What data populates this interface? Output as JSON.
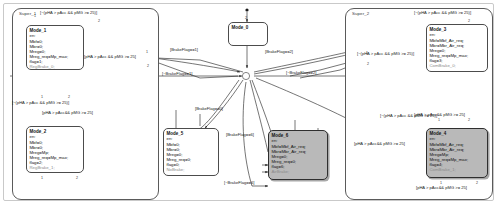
{
  "diagram": {
    "type": "statechart"
  },
  "superstates": [
    {
      "id": "super_1",
      "label": "Super_1"
    },
    {
      "id": "super_2",
      "label": "Super_2"
    }
  ],
  "states": [
    {
      "id": "mode_0",
      "name": "Mode_0",
      "shaded": false,
      "lines": []
    },
    {
      "id": "mode_1",
      "name": "Mode_1",
      "shaded": false,
      "lines": [
        "en:",
        "Mbf=0;",
        "Mbr=0;",
        "Mreg=0;",
        "Mreg_req=Mp_max;",
        "flag=1;",
        "RegBrake_0;"
      ]
    },
    {
      "id": "mode_2",
      "name": "Mode_2",
      "shaded": false,
      "lines": [
        "en:",
        "Mbf=0;",
        "Mbr=0;",
        "Mreg=Mp;",
        "Mreg_req=Mp_max;",
        "flag=2;",
        "RegBrake_1;"
      ]
    },
    {
      "id": "mode_3",
      "name": "Mode_3",
      "shaded": false,
      "lines": [
        "en:",
        "Mbf=Mbf_Air_req;",
        "Mbr=Mbr_Air_req;",
        "Mreg=0;",
        "Mreg_req=Mp_max;",
        "flag=3;",
        "ComBrake_0;"
      ]
    },
    {
      "id": "mode_4",
      "name": "Mode_4",
      "shaded": true,
      "lines": [
        "en:",
        "Mbf=Mbf_Air_req;",
        "Mbr=Mbr_Air_req;",
        "Mreg=Mp;",
        "Mreg_req=Mp_max;",
        "flag=4;",
        "ComBrake_1;"
      ]
    },
    {
      "id": "mode_5",
      "name": "Mode_5",
      "shaded": false,
      "lines": [
        "en:",
        "Mbf=0;",
        "Mbr=0;",
        "Mreg=0;",
        "Mreg_req=0;",
        "flag=0;",
        "NoBrake;"
      ]
    },
    {
      "id": "mode_6",
      "name": "Mode_6",
      "shaded": true,
      "lines": [
        "en:",
        "Mbf=Mbf_Air_req;",
        "Mbr=Mbr_Air_req;",
        "Mreg=0;",
        "Mreg_req=0;",
        "flag=6;",
        "AirBrake;"
      ]
    }
  ],
  "transition_labels": [
    {
      "id": "t_s1_top",
      "text": "[~(pHA > pAcc && pMG >= 25)]"
    },
    {
      "id": "t_s1_mid_right",
      "text": "[pHA > pAcc && pMG >= 25]"
    },
    {
      "id": "t_s1_bot_left",
      "text": "[~(pHA > pAcc && pMG >= 25)]"
    },
    {
      "id": "t_s1_bot_right",
      "text": "[pHA > pAcc&& pMG >= 25]"
    },
    {
      "id": "t_bf1",
      "text": "[BrakeFlag==1]"
    },
    {
      "id": "t_nbf1",
      "text": "[~BrakeFlag==1]"
    },
    {
      "id": "t_nbf2",
      "text": "[~BrakeFlag==2]"
    },
    {
      "id": "t_bf2",
      "text": "[BrakeFlag==2]"
    },
    {
      "id": "t_bf0",
      "text": "[BrakeFlag==0]"
    },
    {
      "id": "t_bf6",
      "text": "[BrakeFlag==6]"
    },
    {
      "id": "t_nbf6",
      "text": "[~BrakeFlag==6]"
    },
    {
      "id": "t_s2_top",
      "text": "[~(pHA > pAcc && pMG >= 25)]"
    },
    {
      "id": "t_s2_left",
      "text": "[~(pHA > pAcc && pMG >= 25)]"
    },
    {
      "id": "t_s2_mid",
      "text": "[~(pHA > pAcc && pMG >= 25)]"
    },
    {
      "id": "t_s2_m4_top",
      "text": "[pHA > pAcc&& pMG >= 25]"
    },
    {
      "id": "t_s2_m4_left",
      "text": "[pHA > pAcc&& pMG >= 25]"
    },
    {
      "id": "t_s2_m4_bot",
      "text": "[pHA > pAcc&& pMG >= 25]"
    }
  ],
  "transition_order_numbers": {
    "n1": "1",
    "n2": "2",
    "n3": "3",
    "n4": "4",
    "n5": "5",
    "n6": "6"
  }
}
